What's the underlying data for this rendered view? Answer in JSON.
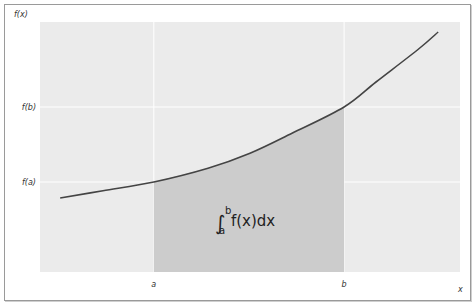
{
  "chart_data": {
    "type": "area",
    "title": "",
    "xlabel": "x",
    "ylabel": "f(x)",
    "xlim": [
      0,
      10
    ],
    "ylim": [
      0,
      10
    ],
    "grid": true,
    "x_ticks": [
      {
        "value": 2.71,
        "label": "a"
      },
      {
        "value": 7.24,
        "label": "b"
      }
    ],
    "y_ticks": [
      {
        "value": 3.6,
        "label": "f(a)"
      },
      {
        "value": 6.6,
        "label": "f(b)"
      }
    ],
    "series": [
      {
        "name": "f(x)",
        "x": [
          0.48,
          1.5,
          2.71,
          4.0,
          5.0,
          6.0,
          7.24,
          8.0,
          9.0,
          9.48
        ],
        "y": [
          2.96,
          3.25,
          3.6,
          4.15,
          4.75,
          5.55,
          6.6,
          7.6,
          8.9,
          9.6
        ]
      }
    ],
    "shaded_region": {
      "from": "a",
      "to": "b",
      "x0": 2.71,
      "x1": 7.24
    },
    "annotation": {
      "integral_sign": "∫",
      "upper": "b",
      "lower": "a",
      "integrand": "f(x)dx"
    },
    "colors": {
      "plot_bg": "#ebebeb",
      "shade": "#cccccc",
      "curve": "#444444",
      "grid": "#ffffff"
    }
  }
}
